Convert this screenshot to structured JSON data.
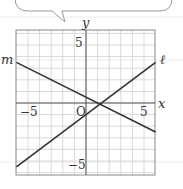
{
  "chart_data": {
    "type": "line",
    "title": "",
    "xlabel": "x",
    "ylabel": "y",
    "xlim": [
      -6,
      6
    ],
    "ylim": [
      -6.2,
      6.3
    ],
    "grid": true,
    "grid_step": 1,
    "tick_labels": {
      "x": [
        "-5",
        "5"
      ],
      "y": [
        "5",
        "-5"
      ],
      "origin": "O"
    },
    "series": [
      {
        "name": "ℓ",
        "slope": 0.75,
        "intercept": -1,
        "x": [
          -6,
          6
        ],
        "y": [
          -5.5,
          3.5
        ]
      },
      {
        "name": "m",
        "slope": -0.5,
        "intercept": 0.5,
        "x": [
          -6,
          6
        ],
        "y": [
          3.5,
          -2.5
        ]
      }
    ],
    "legend": "line labels at ends: m at left, ℓ at right"
  },
  "labels": {
    "y_axis": "y",
    "x_axis": "x",
    "origin": "O",
    "y_pos5": "5",
    "y_neg5": "−5",
    "x_neg5": "−5",
    "x_pos5": "5",
    "line_m": "m",
    "line_l": "ℓ"
  },
  "colors": {
    "line": "#333333",
    "grid": "#cfcfcf",
    "axis": "#555555",
    "frame": "#888888"
  }
}
